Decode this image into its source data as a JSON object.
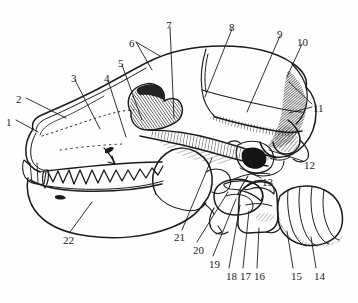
{
  "figure": {
    "type": "anatomical-line-drawing",
    "background_color": "#fefefe",
    "ink_color": "#1b1b1b",
    "width": 358,
    "height": 303
  },
  "labels": [
    {
      "id": "1",
      "text": "1",
      "x": 6,
      "y": 117,
      "leader": [
        [
          16,
          120
        ],
        [
          38,
          132
        ]
      ]
    },
    {
      "id": "2",
      "text": "2",
      "x": 16,
      "y": 94,
      "leader": [
        [
          26,
          98
        ],
        [
          66,
          118
        ]
      ]
    },
    {
      "id": "3",
      "text": "3",
      "x": 71,
      "y": 73,
      "leader": [
        [
          75,
          80
        ],
        [
          100,
          129
        ]
      ]
    },
    {
      "id": "4",
      "text": "4",
      "x": 104,
      "y": 73,
      "leader": [
        [
          108,
          80
        ],
        [
          126,
          137
        ]
      ]
    },
    {
      "id": "5",
      "text": "5",
      "x": 118,
      "y": 58,
      "leader": [
        [
          122,
          65
        ],
        [
          142,
          120
        ]
      ]
    },
    {
      "id": "6",
      "text": "6",
      "x": 129,
      "y": 38,
      "leader": [
        [
          136,
          42
        ],
        [
          160,
          56
        ]
      ],
      "leader2": [
        [
          136,
          42
        ],
        [
          152,
          70
        ]
      ]
    },
    {
      "id": "7",
      "text": "7",
      "x": 166,
      "y": 20,
      "leader": [
        [
          170,
          27
        ],
        [
          174,
          118
        ]
      ]
    },
    {
      "id": "8",
      "text": "8",
      "x": 229,
      "y": 22,
      "leader": [
        [
          232,
          29
        ],
        [
          205,
          97
        ]
      ]
    },
    {
      "id": "9",
      "text": "9",
      "x": 277,
      "y": 29,
      "leader": [
        [
          280,
          36
        ],
        [
          247,
          112
        ]
      ]
    },
    {
      "id": "10",
      "text": "10",
      "x": 297,
      "y": 37,
      "leader": [
        [
          302,
          44
        ],
        [
          287,
          77
        ]
      ]
    },
    {
      "id": "11",
      "text": "11",
      "x": 313,
      "y": 103,
      "leader": [
        [
          312,
          104
        ],
        [
          289,
          82
        ]
      ],
      "leader2": [
        [
          312,
          107
        ],
        [
          289,
          113
        ]
      ]
    },
    {
      "id": "12",
      "text": "12",
      "x": 304,
      "y": 160,
      "leader": [
        [
          303,
          161
        ],
        [
          269,
          150
        ]
      ]
    },
    {
      "id": "13",
      "text": "13",
      "x": 262,
      "y": 177,
      "leader": [
        [
          261,
          178
        ],
        [
          240,
          168
        ]
      ]
    },
    {
      "id": "14",
      "text": "14",
      "x": 314,
      "y": 271,
      "leader": [
        [
          316,
          268
        ],
        [
          311,
          237
        ]
      ]
    },
    {
      "id": "15",
      "text": "15",
      "x": 291,
      "y": 271,
      "leader": [
        [
          293,
          268
        ],
        [
          287,
          231
        ]
      ]
    },
    {
      "id": "16",
      "text": "16",
      "x": 254,
      "y": 271,
      "leader": [
        [
          257,
          268
        ],
        [
          259,
          228
        ]
      ]
    },
    {
      "id": "17",
      "text": "17",
      "x": 240,
      "y": 271,
      "leader": [
        [
          243,
          268
        ],
        [
          249,
          211
        ]
      ]
    },
    {
      "id": "18",
      "text": "18",
      "x": 226,
      "y": 271,
      "leader": [
        [
          229,
          268
        ],
        [
          240,
          205
        ]
      ]
    },
    {
      "id": "19",
      "text": "19",
      "x": 209,
      "y": 259,
      "leader": [
        [
          213,
          256
        ],
        [
          236,
          199
        ]
      ]
    },
    {
      "id": "20",
      "text": "20",
      "x": 193,
      "y": 245,
      "leader": [
        [
          197,
          242
        ],
        [
          228,
          192
        ]
      ]
    },
    {
      "id": "21",
      "text": "21",
      "x": 174,
      "y": 232,
      "leader": [
        [
          182,
          230
        ],
        [
          212,
          158
        ]
      ]
    },
    {
      "id": "22",
      "text": "22",
      "x": 63,
      "y": 235,
      "leader": [
        [
          70,
          232
        ],
        [
          92,
          202
        ]
      ]
    }
  ]
}
